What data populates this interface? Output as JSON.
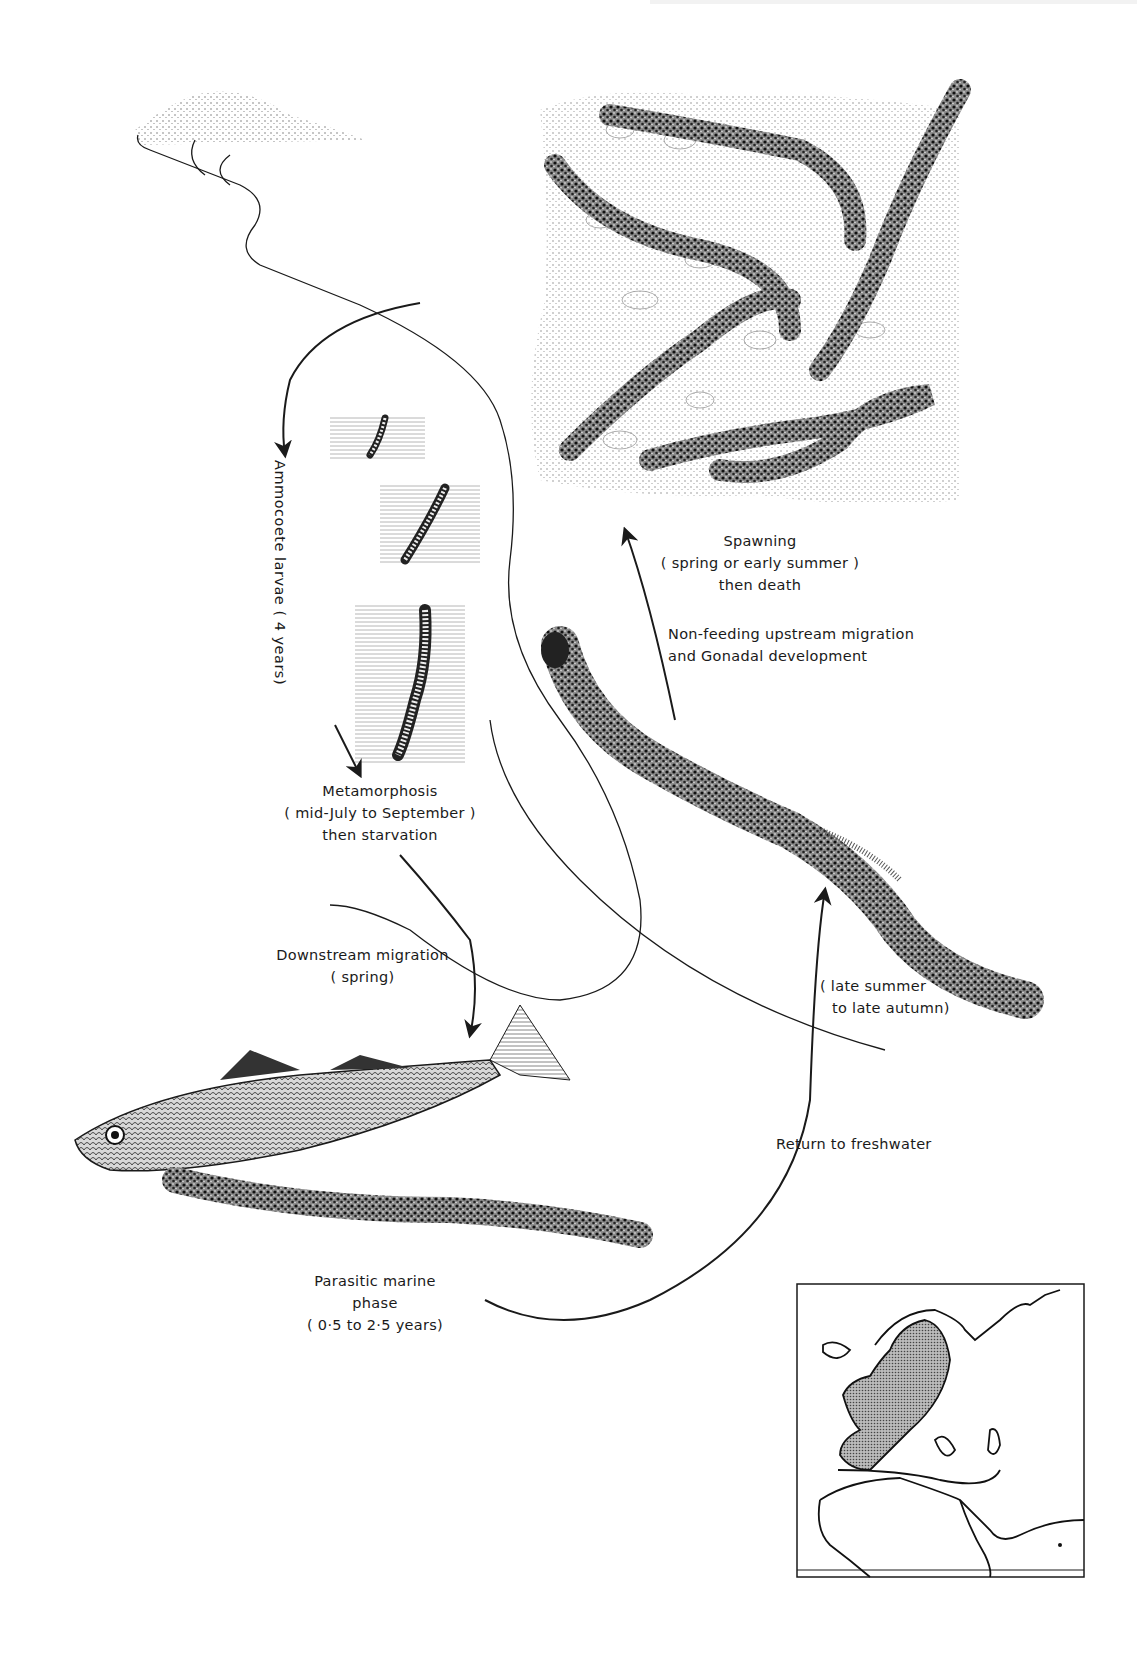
{
  "figure": {
    "colors": {
      "ink": "#1a1a1a",
      "stipple": "#555555",
      "paper": "#ffffff",
      "range_fill": "#9a9a9a"
    }
  },
  "labels": {
    "spawning": {
      "line1": "Spawning",
      "line2": "( spring or early summer )",
      "line3": "then death"
    },
    "upstream": {
      "line1": "Non-feeding upstream migration",
      "line2": "and Gonadal development"
    },
    "larvae": {
      "text": "Ammocoete  larvae  ( 4 years)"
    },
    "metamorphosis": {
      "line1": "Metamorphosis",
      "line2": "( mid-July to September )",
      "line3": "then starvation"
    },
    "downstream": {
      "line1": "Downstream migration",
      "line2": "( spring)"
    },
    "return_period": {
      "line1": "( late summer",
      "line2": "to late autumn)"
    },
    "return": {
      "text": "Return to freshwater"
    },
    "parasitic": {
      "line1": "Parasitic marine",
      "line2": "phase",
      "line3": "( 0·5 to 2·5 years)"
    }
  },
  "illustrations": [
    {
      "name": "spawning-ground-lampreys",
      "count": 4
    },
    {
      "name": "ammocoete-burrows",
      "count": 3
    },
    {
      "name": "adult-upstream-lamprey",
      "count": 1
    },
    {
      "name": "host-fish-with-parasitic-lamprey",
      "count": 2
    },
    {
      "name": "distribution-map-europe",
      "count": 1
    }
  ]
}
